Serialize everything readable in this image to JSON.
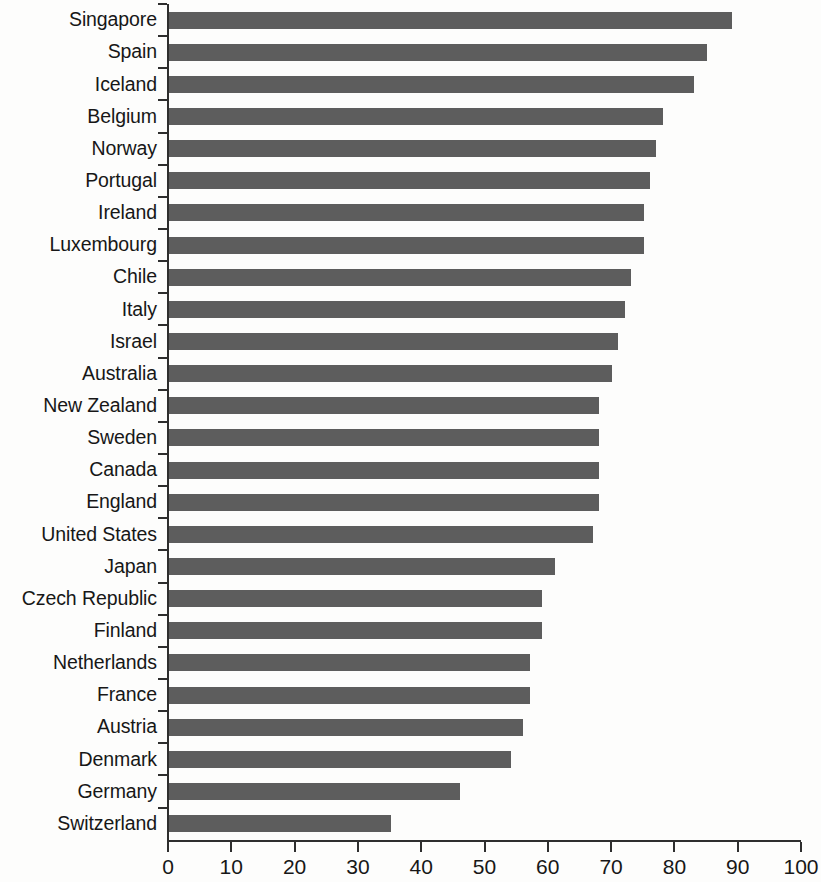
{
  "chart_data": {
    "type": "bar",
    "orientation": "horizontal",
    "title": "",
    "subtitle": "",
    "xlabel": "",
    "ylabel": "",
    "xlim": [
      0,
      100
    ],
    "x_ticks": [
      0,
      10,
      20,
      30,
      40,
      50,
      60,
      70,
      80,
      90,
      100
    ],
    "x_tick_labels": [
      "0",
      "10",
      "20",
      "30",
      "40",
      "50",
      "60",
      "70",
      "80",
      "90",
      "100"
    ],
    "grid": false,
    "legend": null,
    "bar_color": "#5d5d5d",
    "axis_color": "#2e2e2e",
    "text_color": "#171717",
    "categories": [
      "Singapore",
      "Spain",
      "Iceland",
      "Belgium",
      "Norway",
      "Portugal",
      "Ireland",
      "Luxembourg",
      "Chile",
      "Italy",
      "Israel",
      "Australia",
      "New Zealand",
      "Sweden",
      "Canada",
      "England",
      "United States",
      "Japan",
      "Czech Republic",
      "Finland",
      "Netherlands",
      "France",
      "Austria",
      "Denmark",
      "Germany",
      "Switzerland"
    ],
    "values": [
      89,
      85,
      83,
      78,
      77,
      76,
      75,
      75,
      73,
      72,
      71,
      70,
      68,
      68,
      68,
      68,
      67,
      61,
      59,
      59,
      57,
      57,
      56,
      54,
      46,
      35
    ]
  },
  "bleed": {
    "text": ""
  }
}
